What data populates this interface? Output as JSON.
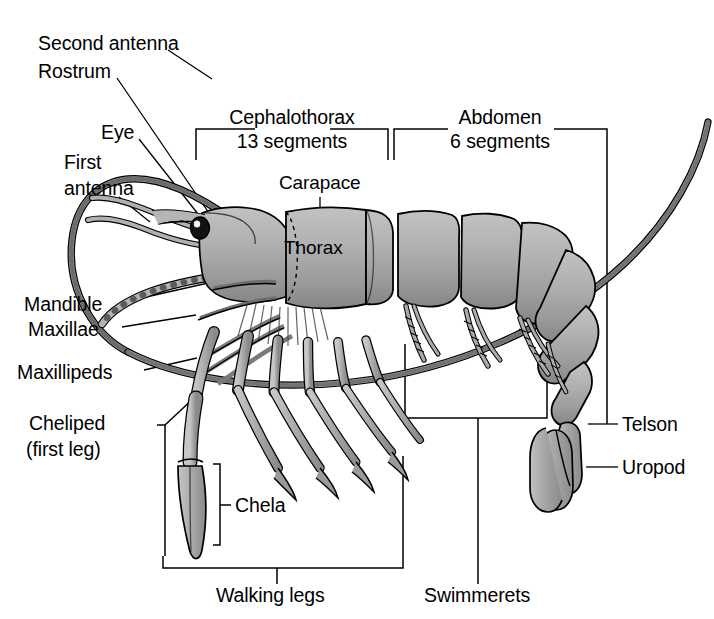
{
  "figure": {
    "background_color": "#ffffff",
    "ink_color": "#000000",
    "body_fill_color": "#a9a9a9",
    "body_shade_color": "#8d8d8d",
    "body_highlight_color": "#c9c9c9"
  },
  "labels": {
    "second_antenna": "Second antenna",
    "rostrum": "Rostrum",
    "eye": "Eye",
    "first_antenna_line1": "First",
    "first_antenna_line2": "antenna",
    "mandible": "Mandible",
    "maxillae": "Maxillae",
    "maxillipeds": "Maxillipeds",
    "cheliped_line1": "Cheliped",
    "cheliped_line2": "(first leg)",
    "chela": "Chela",
    "walking_legs": "Walking legs",
    "swimmerets": "Swimmerets",
    "carapace": "Carapace",
    "thorax": "Thorax",
    "telson": "Telson",
    "uropod": "Uropod"
  },
  "brackets": {
    "cephalothorax_line1": "Cephalothorax",
    "cephalothorax_line2": "13 segments",
    "abdomen_line1": "Abdomen",
    "abdomen_line2": "6 segments"
  }
}
